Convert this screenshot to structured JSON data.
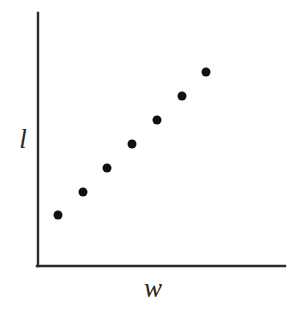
{
  "chart_data": {
    "type": "scatter",
    "title": "",
    "subtitle": "",
    "xlabel": "w",
    "ylabel": "l",
    "grid": false,
    "legend": null,
    "tick_labels": {
      "x": [],
      "y": []
    },
    "axis_style": {
      "spines": [
        "left",
        "bottom"
      ],
      "arrows": false,
      "ticks": false,
      "color": "#2b2b2b",
      "line_width_px": 2
    },
    "xlim": [
      0,
      1
    ],
    "ylim": [
      0,
      1
    ],
    "series": [
      {
        "name": "observations",
        "marker": "filled-circle",
        "marker_color": "#111111",
        "marker_size_px": 9,
        "point_count": 7,
        "points": [
          {
            "index": 1,
            "x": 0.08,
            "y": 0.2,
            "px": 58,
            "py": 215
          },
          {
            "index": 2,
            "x": 0.18,
            "y": 0.29,
            "px": 83,
            "py": 192
          },
          {
            "index": 3,
            "x": 0.28,
            "y": 0.39,
            "px": 107,
            "py": 168
          },
          {
            "index": 4,
            "x": 0.38,
            "y": 0.48,
            "px": 132,
            "py": 144
          },
          {
            "index": 5,
            "x": 0.48,
            "y": 0.58,
            "px": 157,
            "py": 120
          },
          {
            "index": 6,
            "x": 0.58,
            "y": 0.67,
            "px": 182,
            "py": 96
          },
          {
            "index": 7,
            "x": 0.68,
            "y": 0.77,
            "px": 206,
            "py": 72
          }
        ]
      }
    ],
    "relationship": "increasing, approximately linear positive association"
  },
  "figure": {
    "background_color": "#ffffff",
    "width_px": 296,
    "height_px": 315
  },
  "axes": {
    "y_axis": {
      "name": "l",
      "x_px": 38,
      "y_top_px": 13,
      "y_bottom_px": 266
    },
    "x_axis": {
      "name": "w",
      "y_px": 266,
      "x_left_px": 38,
      "x_right_px": 285
    }
  },
  "labels": {
    "y": "l",
    "x": "w"
  }
}
